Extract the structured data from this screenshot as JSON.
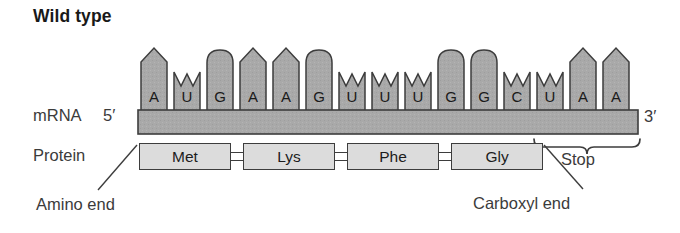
{
  "figure": {
    "title": "Wild type",
    "accent_fill": "#a9a9a9",
    "stroke": "#3d3d3d",
    "box_fill": "#dcdcdc"
  },
  "rows": {
    "mrna_label": "mRNA",
    "protein_label": "Protein",
    "five_prime": "5′",
    "three_prime": "3′"
  },
  "mrna": {
    "sequence": "AUGAAGUUUGGCUAA",
    "bases": [
      {
        "letter": "A",
        "shape": "pointed",
        "x": 141
      },
      {
        "letter": "U",
        "shape": "notched",
        "x": 174
      },
      {
        "letter": "G",
        "shape": "rounded",
        "x": 207
      },
      {
        "letter": "A",
        "shape": "pointed",
        "x": 240
      },
      {
        "letter": "A",
        "shape": "pointed",
        "x": 273
      },
      {
        "letter": "G",
        "shape": "rounded",
        "x": 306
      },
      {
        "letter": "U",
        "shape": "notched",
        "x": 339
      },
      {
        "letter": "U",
        "shape": "notched",
        "x": 372
      },
      {
        "letter": "U",
        "shape": "notched",
        "x": 405
      },
      {
        "letter": "G",
        "shape": "rounded",
        "x": 438
      },
      {
        "letter": "G",
        "shape": "rounded",
        "x": 471
      },
      {
        "letter": "C",
        "shape": "notched",
        "x": 504
      },
      {
        "letter": "U",
        "shape": "notched",
        "x": 537
      },
      {
        "letter": "A",
        "shape": "pointed",
        "x": 570
      },
      {
        "letter": "A",
        "shape": "pointed",
        "x": 603
      }
    ]
  },
  "protein": {
    "amino_acids": [
      {
        "name": "Met",
        "x": 139,
        "width": 92
      },
      {
        "name": "Lys",
        "x": 243,
        "width": 92
      },
      {
        "name": "Phe",
        "x": 347,
        "width": 92
      },
      {
        "name": "Gly",
        "x": 451,
        "width": 92
      }
    ],
    "bonds": [
      {
        "x": 231
      },
      {
        "x": 335
      },
      {
        "x": 439
      }
    ]
  },
  "annotations": {
    "stop": "Stop",
    "amino_end": "Amino end",
    "carboxyl_end": "Carboxyl end"
  }
}
